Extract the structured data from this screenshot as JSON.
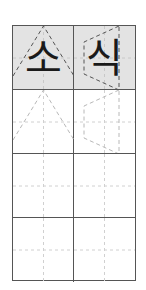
{
  "worksheet": {
    "title": "Korean handwriting practice grid",
    "characters": [
      "소",
      "식"
    ],
    "rows": 4,
    "columns": 2,
    "model_row_fill": "#e3e3e3",
    "border_color": "#555555",
    "guide_color": "#c8c8c8",
    "trace_color": "#b0b0b0",
    "model_outline_color": "#555555"
  }
}
